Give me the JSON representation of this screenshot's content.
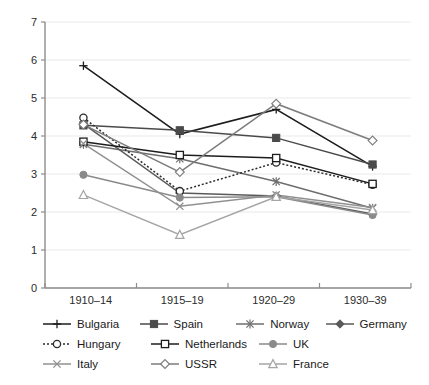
{
  "chart_data": {
    "type": "line",
    "title": "",
    "subtitle": "",
    "xlabel": "",
    "ylabel": "",
    "categories": [
      "1910–14",
      "1915–19",
      "1920–29",
      "1930–39"
    ],
    "xlim": [
      0,
      3
    ],
    "ylim": [
      0,
      7
    ],
    "yticks": [
      0,
      1,
      2,
      3,
      4,
      5,
      6,
      7
    ],
    "ytick_labels": [
      "0",
      "1",
      "2",
      "3",
      "4",
      "5",
      "6",
      "7"
    ],
    "grid": "horizontal",
    "legend_position": "bottom",
    "legend_columns": 4,
    "series": [
      {
        "name": "Bulgaria",
        "marker": "plus",
        "line": "solid",
        "color": "#1d1d1d",
        "values": [
          5.85,
          4.05,
          4.7,
          3.2
        ]
      },
      {
        "name": "Spain",
        "marker": "filled-square",
        "line": "solid",
        "color": "#4a4a4a",
        "values": [
          4.28,
          4.15,
          3.95,
          3.25
        ]
      },
      {
        "name": "Norway",
        "marker": "asterisk",
        "line": "solid",
        "color": "#6e6e6e",
        "values": [
          3.78,
          3.4,
          2.8,
          2.1
        ]
      },
      {
        "name": "Germany",
        "marker": "filled-diamond",
        "line": "solid",
        "color": "#5a5a5a",
        "values": [
          4.32,
          2.5,
          2.42,
          1.95
        ]
      },
      {
        "name": "Hungary",
        "marker": "open-circle",
        "line": "dotted",
        "color": "#2b2b2b",
        "values": [
          4.48,
          2.55,
          3.3,
          2.72
        ]
      },
      {
        "name": "Netherlands",
        "marker": "open-square",
        "line": "solid",
        "color": "#1d1d1d",
        "values": [
          3.85,
          3.5,
          3.42,
          2.74
        ]
      },
      {
        "name": "UK",
        "marker": "filled-circle",
        "line": "solid",
        "color": "#8a8a8a",
        "values": [
          2.98,
          2.38,
          2.4,
          1.92
        ]
      },
      {
        "name": "Italy",
        "marker": "cross",
        "line": "solid",
        "color": "#909090",
        "values": [
          3.8,
          2.15,
          2.45,
          2.12
        ]
      },
      {
        "name": "USSR",
        "marker": "open-diamond",
        "line": "solid",
        "color": "#7d7d7d",
        "values": [
          4.3,
          3.05,
          4.85,
          3.88
        ]
      },
      {
        "name": "France",
        "marker": "triangle",
        "line": "solid",
        "color": "#a5a5a5",
        "values": [
          2.45,
          1.4,
          2.4,
          2.05
        ]
      }
    ]
  },
  "legend": {
    "rows": [
      [
        {
          "label": "Bulgaria",
          "marker": "plus",
          "line": "solid",
          "color": "#1d1d1d"
        },
        {
          "label": "Spain",
          "marker": "filled-square",
          "line": "solid",
          "color": "#4a4a4a"
        },
        {
          "label": "Norway",
          "marker": "asterisk",
          "line": "solid",
          "color": "#6e6e6e"
        },
        {
          "label": "Germany",
          "marker": "filled-diamond",
          "line": "solid",
          "color": "#5a5a5a"
        }
      ],
      [
        {
          "label": "Hungary",
          "marker": "open-circle",
          "line": "dotted",
          "color": "#2b2b2b"
        },
        {
          "label": "Netherlands",
          "marker": "open-square",
          "line": "solid",
          "color": "#1d1d1d"
        },
        {
          "label": "UK",
          "marker": "filled-circle",
          "line": "solid",
          "color": "#8a8a8a"
        }
      ],
      [
        {
          "label": "Italy",
          "marker": "cross",
          "line": "solid",
          "color": "#909090"
        },
        {
          "label": "USSR",
          "marker": "open-diamond",
          "line": "solid",
          "color": "#7d7d7d"
        },
        {
          "label": "France",
          "marker": "triangle",
          "line": "solid",
          "color": "#a5a5a5"
        }
      ]
    ]
  },
  "colors": {
    "background": "#ffffff",
    "gridline": "#e9e9e9",
    "axis": "#8d8d8d",
    "text": "#1a1a1a"
  }
}
